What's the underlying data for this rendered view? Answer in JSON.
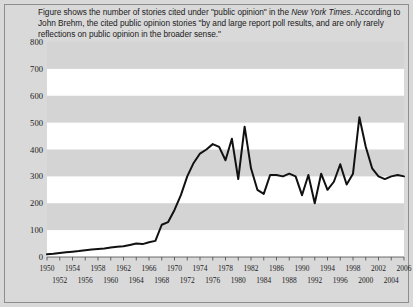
{
  "caption": {
    "line1_a": "Figure shows the number of stories cited under \"public opinion\" in the ",
    "line1_italic": "New York Times",
    "line1_b": ".",
    "line2": "According to John Brehm, the cited public opinion stories \"by and large report poll",
    "line3": "results, and are only rarely reflections on public opinion in the broader sense.\""
  },
  "colors": {
    "page_background": "#d9d9d9",
    "plot_background": "#ffffff",
    "band_fill": "#d4d4d4",
    "line": "#111111",
    "frame": "#8e8e8e",
    "text": "#1a1a1a"
  },
  "chart_data": {
    "type": "line",
    "title": "",
    "xlabel": "",
    "ylabel": "",
    "xlim": [
      1950,
      2006
    ],
    "ylim": [
      0,
      800
    ],
    "yticks": [
      0,
      100,
      200,
      300,
      400,
      500,
      600,
      700,
      800
    ],
    "xticks_top_row": [
      1950,
      1954,
      1958,
      1962,
      1966,
      1970,
      1974,
      1978,
      1982,
      1986,
      1990,
      1994,
      1998,
      2002,
      2006
    ],
    "xticks_bottom_row": [
      1952,
      1956,
      1960,
      1964,
      1968,
      1972,
      1976,
      1980,
      1984,
      1988,
      1992,
      1996,
      2000,
      2004
    ],
    "grid": "horizontal-alternating-bands",
    "legend": "none",
    "series": [
      {
        "name": "Stories citing \"public opinion\" in the New York Times",
        "x": [
          1950,
          1951,
          1952,
          1953,
          1954,
          1955,
          1956,
          1957,
          1958,
          1959,
          1960,
          1961,
          1962,
          1963,
          1964,
          1965,
          1966,
          1967,
          1968,
          1969,
          1970,
          1971,
          1972,
          1973,
          1974,
          1975,
          1976,
          1977,
          1978,
          1979,
          1980,
          1981,
          1982,
          1983,
          1984,
          1985,
          1986,
          1987,
          1988,
          1989,
          1990,
          1991,
          1992,
          1993,
          1994,
          1995,
          1996,
          1997,
          1998,
          1999,
          2000,
          2001,
          2002,
          2003,
          2004,
          2005,
          2006
        ],
        "values": [
          10,
          12,
          15,
          18,
          20,
          22,
          25,
          28,
          30,
          32,
          35,
          38,
          40,
          45,
          50,
          48,
          55,
          60,
          120,
          130,
          175,
          230,
          300,
          350,
          385,
          400,
          420,
          410,
          360,
          440,
          290,
          485,
          330,
          250,
          235,
          305,
          305,
          300,
          310,
          300,
          230,
          305,
          200,
          310,
          250,
          280,
          345,
          270,
          310,
          520,
          410,
          330,
          300,
          290,
          300,
          305,
          300
        ]
      }
    ]
  }
}
